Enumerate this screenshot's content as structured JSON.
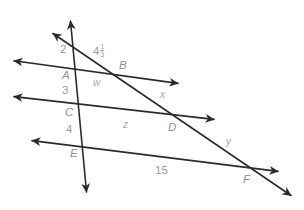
{
  "figure": {
    "ink_color": "#2b2b2b",
    "label_color": "#9a9a9a",
    "background": "#ffffff",
    "width": 304,
    "height": 210
  },
  "labels": {
    "seg_2": "2",
    "point_A": "A",
    "seg_3": "3",
    "point_C": "C",
    "seg_4": "4",
    "point_E": "E",
    "point_B": "B",
    "point_D": "D",
    "point_F": "F",
    "var_w": "w",
    "var_x": "x",
    "var_y": "y",
    "var_z": "z",
    "seg_15": "15",
    "frac_whole": "4",
    "frac_numerator": "1",
    "frac_denominator": "3"
  },
  "geometry": {
    "parallel_line_1": {
      "from_x": 9,
      "from_y": 60,
      "to_x": 183,
      "to_y": 84
    },
    "parallel_line_2": {
      "from_x": 9,
      "from_y": 96,
      "to_x": 219,
      "to_y": 120
    },
    "parallel_line_3": {
      "from_x": 27,
      "from_y": 140,
      "to_x": 283,
      "to_y": 172
    },
    "transversal_vertical": {
      "from_x": 70,
      "from_y": 15,
      "to_x": 87,
      "to_y": 198
    },
    "transversal_diagonal": {
      "from_x": 48,
      "from_y": 30,
      "to_x": 296,
      "to_y": 199
    },
    "intersections": {
      "A": {
        "x": 75,
        "y": 68
      },
      "B": {
        "x": 128,
        "y": 71
      },
      "C": {
        "x": 80,
        "y": 105
      },
      "D": {
        "x": 175,
        "y": 113
      },
      "E": {
        "x": 84,
        "y": 145
      },
      "F": {
        "x": 250,
        "y": 166
      }
    }
  }
}
